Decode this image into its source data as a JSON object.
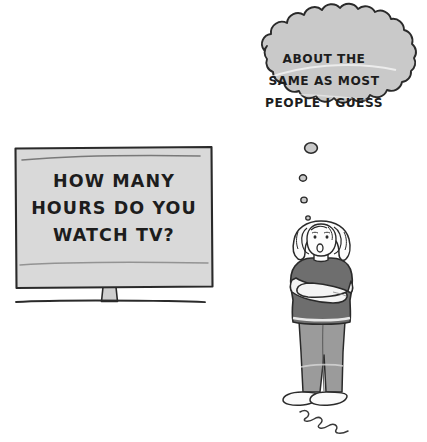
{
  "scene": {
    "title": "Cartoon: person thinking in front of survey sign",
    "background_color": "#ffffff",
    "ink_color": "#2a2a2a"
  },
  "sign": {
    "name": "survey-sign",
    "board_color": "#d9d9d9",
    "post_color": "#cfcfcf",
    "lines": [
      "HOW MANY",
      "HOURS DO YOU",
      "WATCH TV?"
    ]
  },
  "ground": {
    "name": "ground-line",
    "color": "#3a3a3a"
  },
  "thought_bubble": {
    "name": "thought-bubble",
    "fill_color": "#c9c9c9",
    "lines": [
      "ABOUT THE",
      "SAME AS MOST",
      "PEOPLE I GUESS"
    ],
    "dots": [
      {
        "cx": 311,
        "cy": 148,
        "r": 6.2
      },
      {
        "cx": 303,
        "cy": 178,
        "r": 3.4
      },
      {
        "cx": 304,
        "cy": 200,
        "r": 3.0
      },
      {
        "cx": 308,
        "cy": 218,
        "r": 2.2
      }
    ]
  },
  "person": {
    "name": "standing-person",
    "hair_color": "#fbfbfb",
    "skin_color": "#fdfdfd",
    "shirt_color": "#6e6e6e",
    "sleeve_color": "#f4f4f4",
    "pants_color": "#9b9b9b",
    "shoe_color": "#fafafa",
    "expression": "open-mouth-thinking"
  },
  "squiggle": {
    "name": "ground-squiggle",
    "color": "#3a3a3a"
  }
}
